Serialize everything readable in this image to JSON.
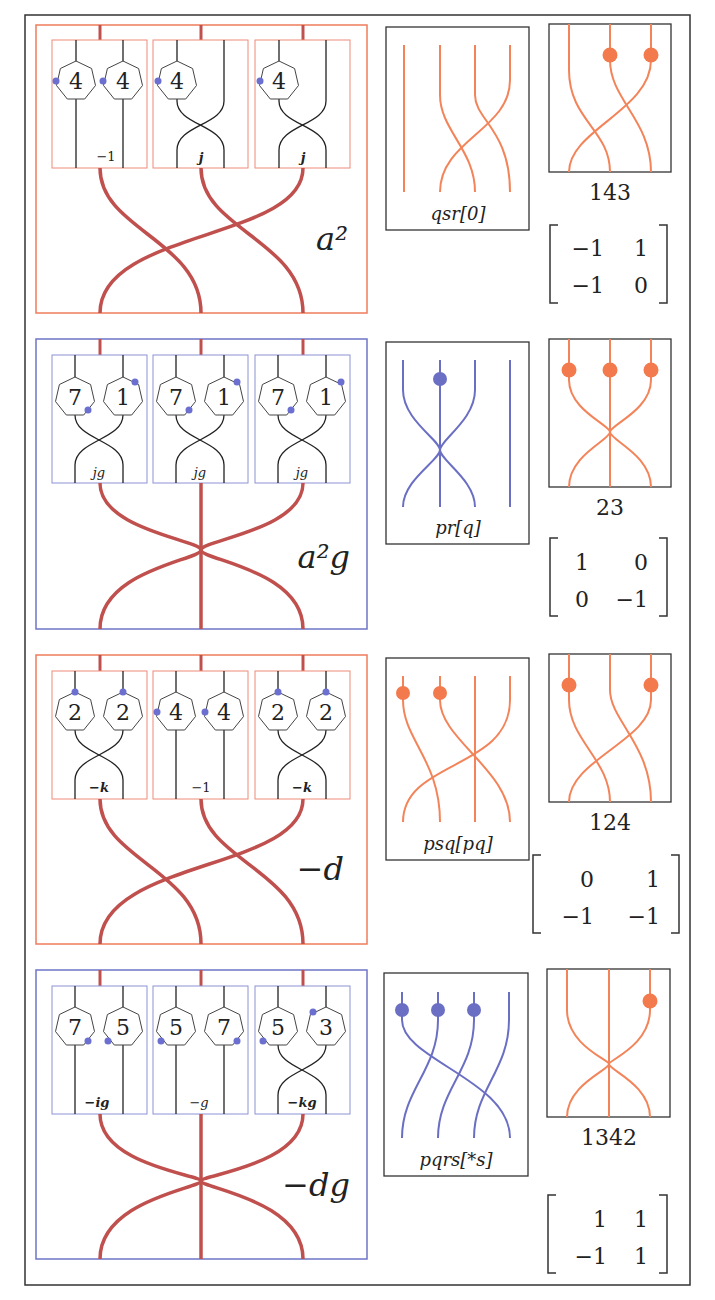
{
  "colors": {
    "orange_frame": "#f07c5c",
    "blue_frame": "#6e74c8",
    "red_strand": "#c0504d",
    "orange_strand": "#f3845a",
    "blue_strand": "#6a6fc4",
    "blue_dot": "#6b6fcf",
    "black": "#222222"
  },
  "rows": [
    {
      "frame_color": "orange",
      "group_label": "a²",
      "sub_boxes": [
        {
          "nodes": [
            "4",
            "4"
          ],
          "coeff": "−1",
          "crossed": false
        },
        {
          "nodes": [
            "4"
          ],
          "coeff": "j",
          "crossed": true
        },
        {
          "nodes": [
            "4"
          ],
          "coeff": "j",
          "crossed": true
        }
      ],
      "braid_label": "qsr[0]",
      "perm_label": "143",
      "matrix": [
        [
          "−1",
          "1"
        ],
        [
          "−1",
          "0"
        ]
      ]
    },
    {
      "frame_color": "blue",
      "group_label": "a²g",
      "sub_boxes": [
        {
          "nodes": [
            "7",
            "1"
          ],
          "coeff": "jg",
          "crossed": true
        },
        {
          "nodes": [
            "7",
            "1"
          ],
          "coeff": "jg",
          "crossed": true
        },
        {
          "nodes": [
            "7",
            "1"
          ],
          "coeff": "jg",
          "crossed": true
        }
      ],
      "braid_label": "pr[q]",
      "perm_label": "23",
      "matrix": [
        [
          "1",
          "0"
        ],
        [
          "0",
          "−1"
        ]
      ]
    },
    {
      "frame_color": "orange",
      "group_label": "−d",
      "sub_boxes": [
        {
          "nodes": [
            "2",
            "2"
          ],
          "coeff": "−k",
          "crossed": true
        },
        {
          "nodes": [
            "4",
            "4"
          ],
          "coeff": "−1",
          "crossed": false
        },
        {
          "nodes": [
            "2",
            "2"
          ],
          "coeff": "−k",
          "crossed": true
        }
      ],
      "braid_label": "psq[pq]",
      "perm_label": "124",
      "matrix": [
        [
          "0",
          "1"
        ],
        [
          "−1",
          "−1"
        ]
      ]
    },
    {
      "frame_color": "blue",
      "group_label": "−dg",
      "sub_boxes": [
        {
          "nodes": [
            "7",
            "5"
          ],
          "coeff": "−ig",
          "crossed": false
        },
        {
          "nodes": [
            "5",
            "7"
          ],
          "coeff": "−g",
          "crossed": false
        },
        {
          "nodes": [
            "5",
            "3"
          ],
          "coeff": "−kg",
          "crossed": true
        }
      ],
      "braid_label": "pqrs[*s]",
      "perm_label": "1342",
      "matrix": [
        [
          "1",
          "1"
        ],
        [
          "−1",
          "1"
        ]
      ]
    }
  ]
}
